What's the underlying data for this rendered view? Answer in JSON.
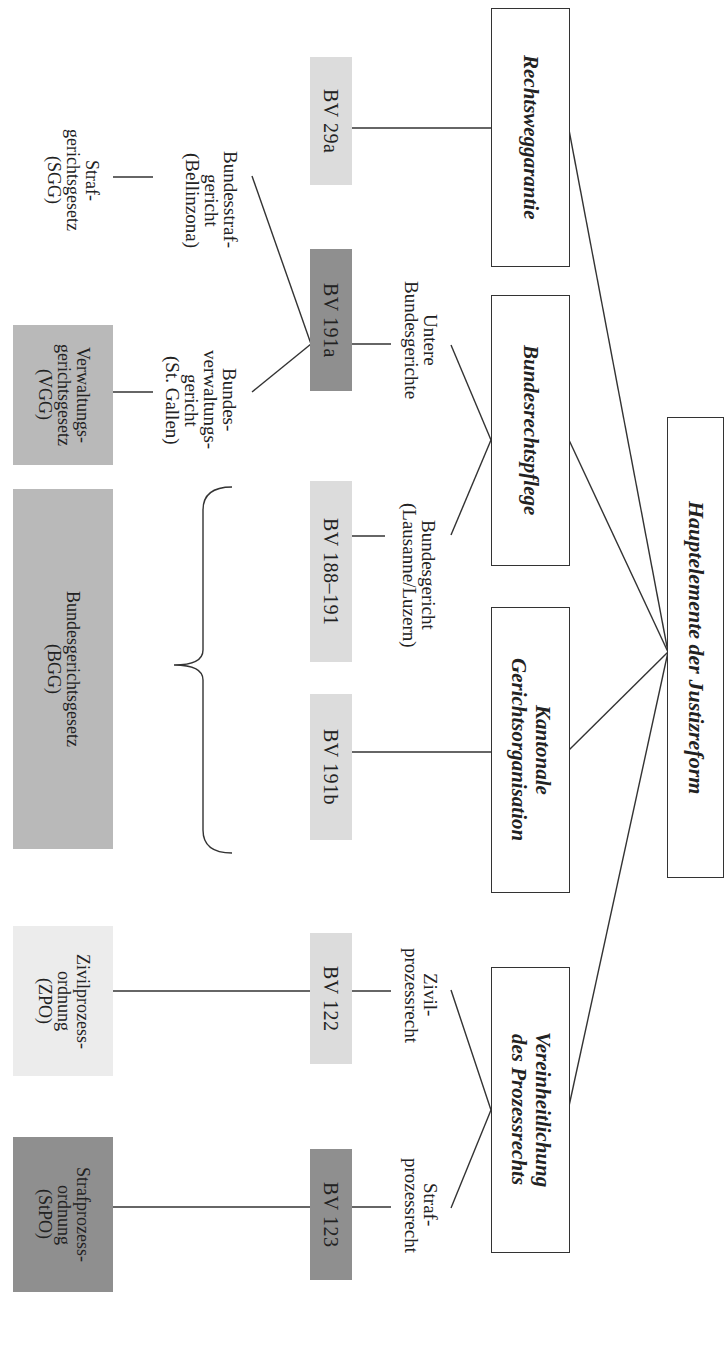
{
  "diagram": {
    "title": "Hauptelemente der Justizreform",
    "categories": [
      {
        "id": "rechtsweggarantie",
        "label": "Rechtsweggarantie"
      },
      {
        "id": "bundesrechtspflege",
        "label": "Bundesrechtspflege"
      },
      {
        "id": "kantonale",
        "label": "Kantonale\nGerichtsorganisation"
      },
      {
        "id": "vereinheitlichung",
        "label": "Vereinheitlichung\ndes Prozessrechts"
      }
    ],
    "sub_labels": [
      {
        "id": "untere",
        "label": "Untere\nBundesgerichte"
      },
      {
        "id": "bundesgericht",
        "label": "Bundesgericht\n(Lausanne/Luzern)"
      },
      {
        "id": "zivil",
        "label": "Zivil-\nprozessrecht"
      },
      {
        "id": "straf",
        "label": "Straf-\nprozessrecht"
      },
      {
        "id": "bundesstraf",
        "label": "Bundesstraf-\ngericht\n(Bellinzona)"
      },
      {
        "id": "bundesverwaltung",
        "label": "Bundes-\nverwaltungs-\ngericht\n(St. Gallen)"
      }
    ],
    "constitution_articles": [
      {
        "id": "bv29a",
        "label": "BV 29a",
        "shade": "light"
      },
      {
        "id": "bv191a",
        "label": "BV 191a",
        "shade": "dark"
      },
      {
        "id": "bv188",
        "label": "BV 188–191",
        "shade": "light"
      },
      {
        "id": "bv191b",
        "label": "BV 191b",
        "shade": "light"
      },
      {
        "id": "bv122",
        "label": "BV 122",
        "shade": "light"
      },
      {
        "id": "bv123",
        "label": "BV 123",
        "shade": "dark"
      }
    ],
    "laws": [
      {
        "id": "sgg",
        "label": "Straf-\ngerichtsgesetz\n(SGG)",
        "shade": "none"
      },
      {
        "id": "vgg",
        "label": "Verwaltungs-\ngerichtsgesetz\n(VGG)",
        "shade": "medium"
      },
      {
        "id": "bgg",
        "label": "Bundesgerichtsgesetz\n(BGG)",
        "shade": "medium"
      },
      {
        "id": "zpo",
        "label": "Zivilprozess-\nordnung\n(ZPO)",
        "shade": "faint"
      },
      {
        "id": "stpo",
        "label": "Strafprozess-\nordnung\n(StPO)",
        "shade": "dark"
      }
    ],
    "colors": {
      "light": "#dcdcdc",
      "dark": "#8f8f8f",
      "medium": "#b9b9b9",
      "faint": "#ececec",
      "line": "#333333"
    }
  }
}
